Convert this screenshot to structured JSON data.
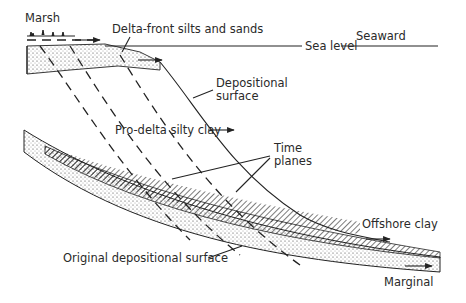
{
  "diagram": {
    "type": "geological cross-section",
    "labels": {
      "marsh": "Marsh",
      "delta_front": "Delta-front silts and sands",
      "sea_level": "Sea level",
      "seaward": "Seaward",
      "depositional_surface_1": "Depositional",
      "depositional_surface_2": "surface",
      "pro_delta": "Pro-delta silty clay",
      "time_planes_1": "Time",
      "time_planes_2": "planes",
      "offshore_clay": "Offshore clay",
      "original_surface": "Original depositional surface",
      "marginal": "Marginal"
    },
    "layers": [
      {
        "name": "Delta-front silts and sands",
        "pattern": "stipple"
      },
      {
        "name": "Pro-delta silty clay",
        "pattern": "blank"
      },
      {
        "name": "Offshore clay",
        "pattern": "hatch"
      },
      {
        "name": "Marginal",
        "pattern": "stipple"
      }
    ],
    "colors": {
      "ink": "#222222",
      "text": "#2a2a2a",
      "background": "#ffffff"
    }
  }
}
